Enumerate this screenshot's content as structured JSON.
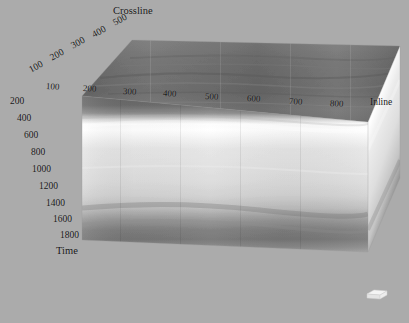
{
  "viewer": {
    "name": "seismic-3d-cube-viewer",
    "background_color": "#ababab",
    "width": 409,
    "height": 323
  },
  "axes": {
    "crossline": {
      "title": "Crossline",
      "ticks": [
        "100",
        "200",
        "300",
        "400",
        "500"
      ],
      "positions": [
        {
          "label": "100",
          "x": 30,
          "y": 66,
          "rot": -29
        },
        {
          "label": "200",
          "x": 51,
          "y": 54,
          "rot": -29
        },
        {
          "label": "300",
          "x": 72,
          "y": 42,
          "rot": -29
        },
        {
          "label": "400",
          "x": 93,
          "y": 31,
          "rot": -29
        },
        {
          "label": "500",
          "x": 114,
          "y": 19,
          "rot": -29
        }
      ],
      "title_x": 113,
      "title_y": 7
    },
    "inline": {
      "title": "Inline",
      "ticks": [
        "100",
        "200",
        "300",
        "400",
        "500",
        "600",
        "700",
        "800"
      ],
      "positions": [
        {
          "label": "100",
          "x": 46,
          "y": 82
        },
        {
          "label": "200",
          "x": 83,
          "y": 84
        },
        {
          "label": "300",
          "x": 123,
          "y": 87
        },
        {
          "label": "400",
          "x": 163,
          "y": 90
        },
        {
          "label": "500",
          "x": 205,
          "y": 92
        },
        {
          "label": "600",
          "x": 247,
          "y": 95
        },
        {
          "label": "700",
          "x": 289,
          "y": 98
        },
        {
          "label": "800",
          "x": 330,
          "y": 100
        }
      ],
      "title_x": 370,
      "title_y": 99
    },
    "time": {
      "title": "Time",
      "ticks": [
        "200",
        "400",
        "600",
        "800",
        "1000",
        "1200",
        "1400",
        "1600",
        "1800"
      ],
      "positions": [
        {
          "label": "200",
          "x": 10,
          "y": 97
        },
        {
          "label": "400",
          "x": 17,
          "y": 114
        },
        {
          "label": "600",
          "x": 24,
          "y": 131
        },
        {
          "label": "800",
          "x": 31,
          "y": 148
        },
        {
          "label": "1000",
          "x": 32,
          "y": 165
        },
        {
          "label": "1200",
          "x": 39,
          "y": 182
        },
        {
          "label": "1400",
          "x": 46,
          "y": 199
        },
        {
          "label": "1600",
          "x": 53,
          "y": 216
        },
        {
          "label": "1800",
          "x": 60,
          "y": 232
        }
      ],
      "title_x": 56,
      "title_y": 247
    }
  },
  "geometry": {
    "front_face": "82,96 368,122 368,252 82,240",
    "top_face": "82,96 132,40 400,46 368,122",
    "right_face": "368,122 400,46 400,178 368,252",
    "notes": "3D seismic volume rendered in perspective"
  },
  "colors": {
    "background": "#ababab",
    "top_face_dark": "#6e6e6e",
    "front_band_bright": "#fcfcfc",
    "front_band_mid": "#dedede",
    "front_band_dark": "#7c7c7c",
    "right_face_light": "#e8e8e8",
    "label_text": "#161616",
    "gizmo": "#f2f2f2"
  },
  "gizmo": {
    "name": "orientation-gizmo",
    "label": ""
  }
}
